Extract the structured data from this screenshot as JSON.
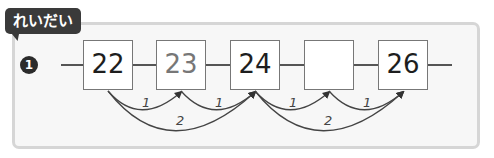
{
  "example_tag": "れいだい",
  "problem_number": "1",
  "sequence": [
    {
      "value": "22",
      "style": "given"
    },
    {
      "value": "23",
      "style": "hint"
    },
    {
      "value": "24",
      "style": "given"
    },
    {
      "value": "",
      "style": "blank"
    },
    {
      "value": "26",
      "style": "given"
    }
  ],
  "arcs": {
    "small": [
      {
        "from": 0,
        "to": 1,
        "label": "1"
      },
      {
        "from": 1,
        "to": 2,
        "label": "1"
      },
      {
        "from": 2,
        "to": 3,
        "label": "1"
      },
      {
        "from": 3,
        "to": 4,
        "label": "1"
      }
    ],
    "large": [
      {
        "from": 0,
        "to": 2,
        "label": "2"
      },
      {
        "from": 2,
        "to": 4,
        "label": "2"
      }
    ]
  },
  "colors": {
    "tag_bg": "#3a3a3a",
    "frame_border": "#d6d6d6",
    "frame_bg": "#f7f7f7",
    "box_border": "#777777",
    "hint_text": "#777777"
  }
}
